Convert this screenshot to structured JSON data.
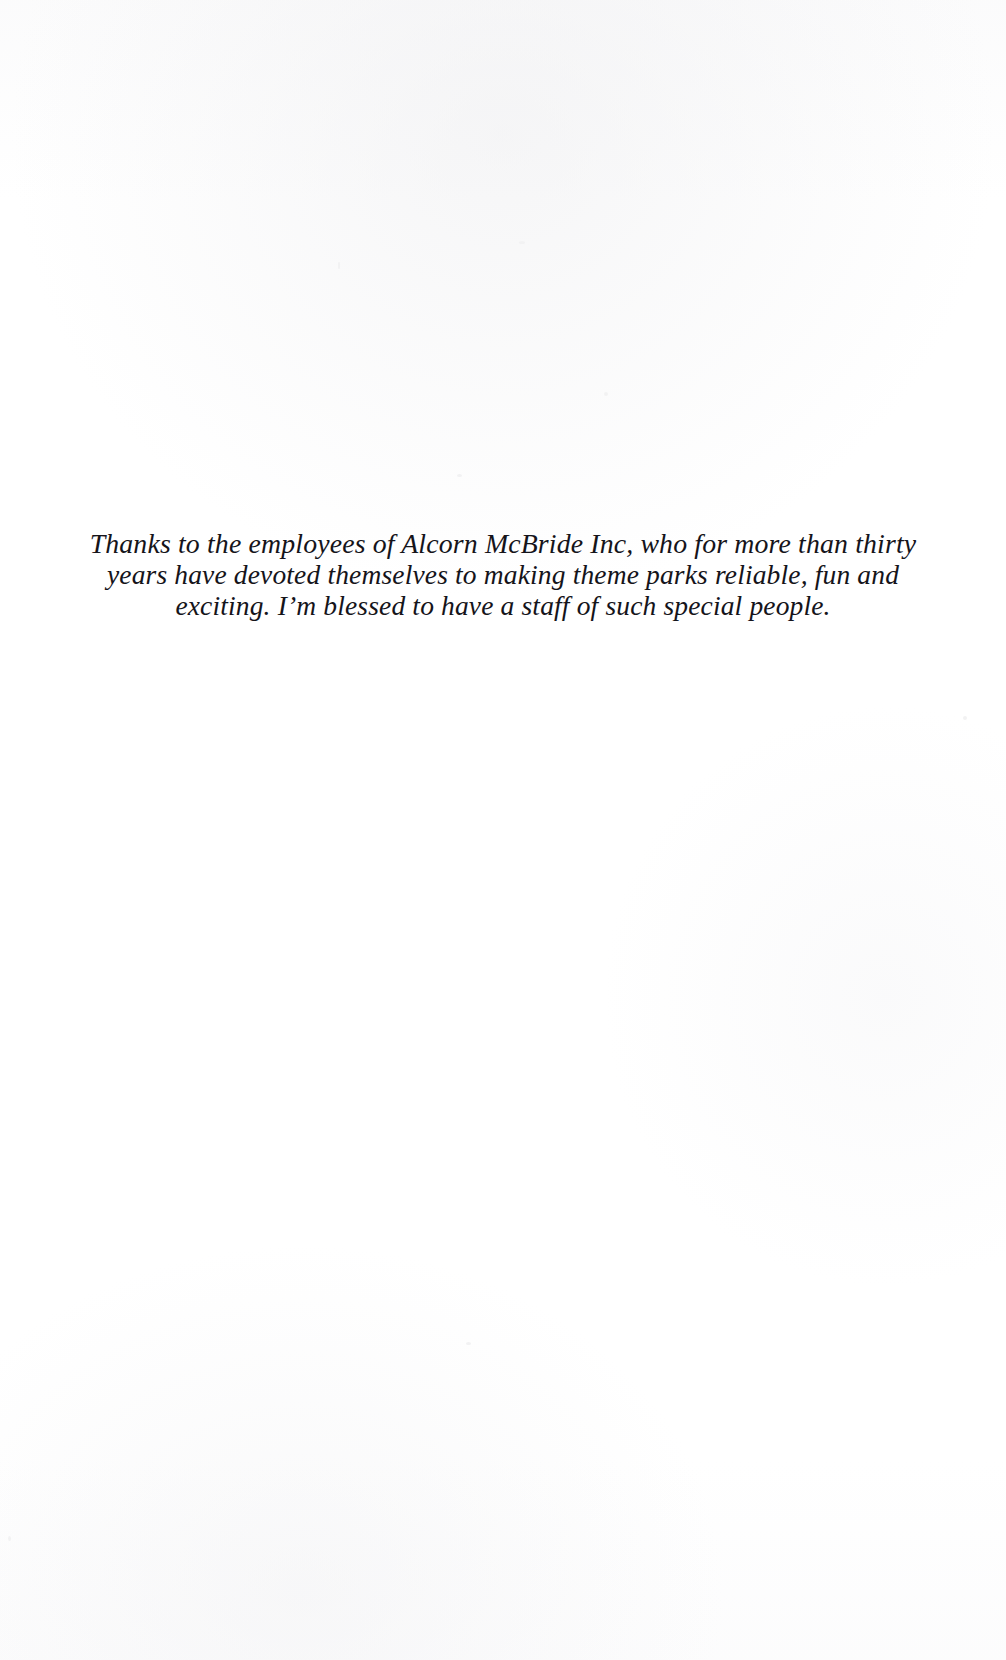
{
  "page": {
    "kind": "book-dedication-page",
    "background_color": "#ffffff",
    "text_color": "#15141a",
    "width": 1006,
    "height": 1660
  },
  "dedication": {
    "full_text": "Thanks to the employees of Alcorn McBride Inc, who for more than thirty years have devoted themselves to making theme parks reliable, fun and exciting. I’m blessed to have a staff of such special people.",
    "lines": [
      "Thanks to the employees of Alcorn McBride Inc, who for more than thirty",
      "years have devoted themselves to making theme parks reliable, fun and",
      "exciting. I’m blessed to have a staff of such special people."
    ]
  }
}
